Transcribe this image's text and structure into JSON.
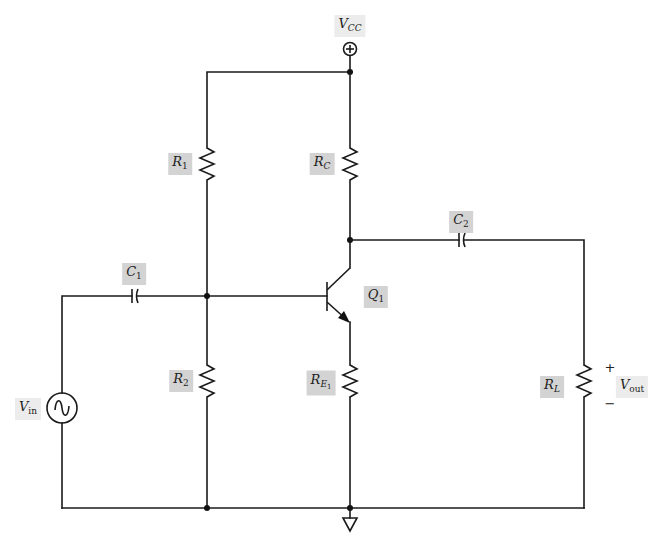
{
  "diagram": {
    "type": "circuit-schematic",
    "colors": {
      "wire": "#1a1a1a",
      "label_bg": "#d3d3d3",
      "label_bg_light": "#ececec",
      "background": "#ffffff"
    },
    "labels": {
      "vcc": {
        "main": "V",
        "sub": "CC"
      },
      "r1": {
        "main": "R",
        "sub": "1"
      },
      "rc": {
        "main": "R",
        "sub": "C"
      },
      "c1": {
        "main": "C",
        "sub": "1"
      },
      "c2": {
        "main": "C",
        "sub": "2"
      },
      "q1": {
        "main": "Q",
        "sub": "1"
      },
      "vin": {
        "main": "V",
        "sub": "in"
      },
      "r2": {
        "main": "R",
        "sub": "2"
      },
      "re1": {
        "main": "R",
        "sub": "E",
        "subsub": "1"
      },
      "rl": {
        "main": "R",
        "sub": "L"
      },
      "vout": {
        "main": "V",
        "sub": "out"
      },
      "plus": "+",
      "minus": "−"
    },
    "components": [
      {
        "id": "VCC",
        "kind": "dc-supply-terminal",
        "icon": "plus-circle-icon"
      },
      {
        "id": "R1",
        "kind": "resistor"
      },
      {
        "id": "RC",
        "kind": "resistor"
      },
      {
        "id": "C1",
        "kind": "capacitor"
      },
      {
        "id": "C2",
        "kind": "capacitor"
      },
      {
        "id": "Q1",
        "kind": "npn-transistor"
      },
      {
        "id": "Vin",
        "kind": "ac-voltage-source",
        "icon": "sine-wave-icon"
      },
      {
        "id": "R2",
        "kind": "resistor"
      },
      {
        "id": "RE1",
        "kind": "resistor"
      },
      {
        "id": "RL",
        "kind": "resistor"
      },
      {
        "id": "GND",
        "kind": "ground",
        "icon": "ground-triangle-icon"
      }
    ],
    "connections": [
      [
        "VCC",
        "R1.top"
      ],
      [
        "VCC",
        "RC.top"
      ],
      [
        "R1.bottom",
        "Q1.base"
      ],
      [
        "R1.bottom",
        "R2.top"
      ],
      [
        "C1.right",
        "Q1.base"
      ],
      [
        "Vin.top",
        "C1.left"
      ],
      [
        "RC.bottom",
        "Q1.collector"
      ],
      [
        "Q1.collector",
        "C2.left"
      ],
      [
        "C2.right",
        "RL.top"
      ],
      [
        "Q1.emitter",
        "RE1.top"
      ],
      [
        "Vin.bottom",
        "GND"
      ],
      [
        "R2.bottom",
        "GND"
      ],
      [
        "RE1.bottom",
        "GND"
      ],
      [
        "RL.bottom",
        "GND"
      ]
    ]
  }
}
